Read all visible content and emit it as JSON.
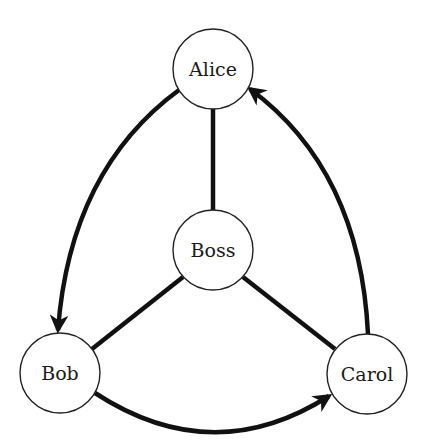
{
  "diagram": {
    "type": "directed-graph",
    "colors": {
      "stroke": "#111111",
      "node_fill": "#ffffff",
      "text": "#1a1a1a"
    },
    "nodes": [
      {
        "id": "alice",
        "label": "Alice"
      },
      {
        "id": "boss",
        "label": "Boss"
      },
      {
        "id": "bob",
        "label": "Bob"
      },
      {
        "id": "carol",
        "label": "Carol"
      }
    ],
    "edges": [
      {
        "from": "Alice",
        "to": "Boss",
        "directed": false
      },
      {
        "from": "Bob",
        "to": "Boss",
        "directed": false
      },
      {
        "from": "Carol",
        "to": "Boss",
        "directed": false
      },
      {
        "from": "Alice",
        "to": "Bob",
        "directed": true
      },
      {
        "from": "Bob",
        "to": "Carol",
        "directed": true
      },
      {
        "from": "Carol",
        "to": "Alice",
        "directed": true
      }
    ]
  }
}
